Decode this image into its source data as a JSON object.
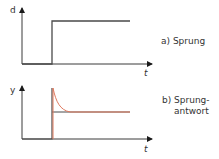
{
  "diagrams": [
    {
      "id": "a",
      "caption": "a) Sprung",
      "y_axis_label": "d",
      "x_axis_label": "t",
      "description": "step input: zero until t0, then jumps to constant level"
    },
    {
      "id": "b",
      "caption_line1": "b) Sprung-",
      "caption_line2": "antwort",
      "y_axis_label": "y",
      "x_axis_label": "t",
      "description": "step response: dark line steps to steady level; orange line spikes at t0 then decays exponentially to steady level"
    }
  ],
  "colors": {
    "axis": "#3a3a3a",
    "step_line": "#4a4a4a",
    "response_curve": "#e07a5f",
    "text": "#333333"
  }
}
